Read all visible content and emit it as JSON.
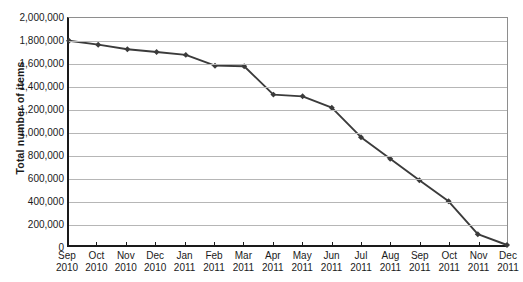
{
  "chart_data": {
    "type": "line",
    "title": "",
    "xlabel": "",
    "ylabel": "Total number of items",
    "ylim": [
      0,
      2000000
    ],
    "ytick_values": [
      0,
      200000,
      400000,
      600000,
      800000,
      1000000,
      1200000,
      1400000,
      1600000,
      1800000,
      2000000
    ],
    "ytick_labels": [
      "0",
      "200,000",
      "400,000",
      "600,000",
      "800,000",
      "1,000,000",
      "1,200,000",
      "1,400,000",
      "1,600,000",
      "1,800,000",
      "2,000,000"
    ],
    "categories": [
      "Sep 2010",
      "Oct 2010",
      "Nov 2010",
      "Dec 2010",
      "Jan 2011",
      "Feb 2011",
      "Mar 2011",
      "Apr 2011",
      "May 2011",
      "Jun 2011",
      "Jul 2011",
      "Aug 2011",
      "Sep 2011",
      "Oct 2011",
      "Nov 2011",
      "Dec 2011"
    ],
    "xtick_months": [
      "Sep",
      "Oct",
      "Nov",
      "Dec",
      "Jan",
      "Feb",
      "Mar",
      "Apr",
      "May",
      "Jun",
      "Jul",
      "Aug",
      "Sep",
      "Oct",
      "Nov",
      "Dec"
    ],
    "xtick_years": [
      "2010",
      "2010",
      "2010",
      "2010",
      "2011",
      "2011",
      "2011",
      "2011",
      "2011",
      "2011",
      "2011",
      "2011",
      "2011",
      "2011",
      "2011",
      "2011"
    ],
    "values": [
      1800000,
      1765000,
      1725000,
      1700000,
      1675000,
      1580000,
      1575000,
      1325000,
      1310000,
      1210000,
      950000,
      760000,
      570000,
      385000,
      95000,
      0
    ],
    "series": [
      {
        "name": "Total number of items",
        "values": [
          1800000,
          1765000,
          1725000,
          1700000,
          1675000,
          1580000,
          1575000,
          1325000,
          1310000,
          1210000,
          950000,
          760000,
          570000,
          385000,
          95000,
          0
        ]
      }
    ],
    "grid": true,
    "legend": "none",
    "marker": "diamond",
    "line_color": "#3b3b3b",
    "grid_color": "#b6b6b6",
    "axis_color": "#1a1a1a"
  }
}
